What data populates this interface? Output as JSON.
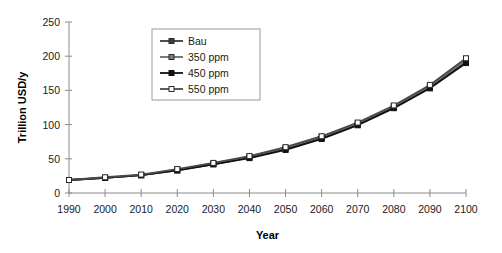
{
  "chart_data": {
    "type": "line",
    "title": "",
    "xlabel": "Year",
    "ylabel": "Trillion USD/y",
    "x": [
      1990,
      2000,
      2010,
      2020,
      2030,
      2040,
      2050,
      2060,
      2070,
      2080,
      2090,
      2100
    ],
    "xticklabels": [
      "1990",
      "2000",
      "2010",
      "2020",
      "2030",
      "2040",
      "2050",
      "2060",
      "2070",
      "2080",
      "2090",
      "2100"
    ],
    "yticks": [
      0,
      50,
      100,
      150,
      200,
      250
    ],
    "yticklabels": [
      "0",
      "50",
      "100",
      "150",
      "200",
      "250"
    ],
    "xlim": [
      1990,
      2100
    ],
    "ylim": [
      0,
      250
    ],
    "grid": false,
    "legend_position": "upper-left-inset",
    "series": [
      {
        "name": "Bau",
        "marker": "filled-dark-square",
        "color": "#3a3a3a",
        "values": [
          19,
          22,
          26,
          33,
          42,
          52,
          64,
          80,
          100,
          125,
          154,
          191
        ]
      },
      {
        "name": "350 ppm",
        "marker": "gray-square",
        "color": "#6b6b6b",
        "values": [
          19,
          22,
          26,
          34,
          43,
          53,
          66,
          82,
          102,
          127,
          156,
          194
        ]
      },
      {
        "name": "450 ppm",
        "marker": "filled-black-square",
        "color": "#111111",
        "values": [
          19,
          22,
          26,
          33,
          42,
          51,
          63,
          79,
          99,
          124,
          153,
          190
        ]
      },
      {
        "name": "550 ppm",
        "marker": "open-white-square",
        "color": "#4a4a4a",
        "values": [
          19,
          23,
          27,
          35,
          44,
          54,
          67,
          83,
          103,
          128,
          158,
          197
        ]
      }
    ]
  },
  "legend": {
    "entries": [
      {
        "label": "Bau"
      },
      {
        "label": "350 ppm"
      },
      {
        "label": "450 ppm"
      },
      {
        "label": "550 ppm"
      }
    ]
  },
  "axes": {
    "y_title": "Trillion USD/y",
    "x_title": "Year"
  }
}
